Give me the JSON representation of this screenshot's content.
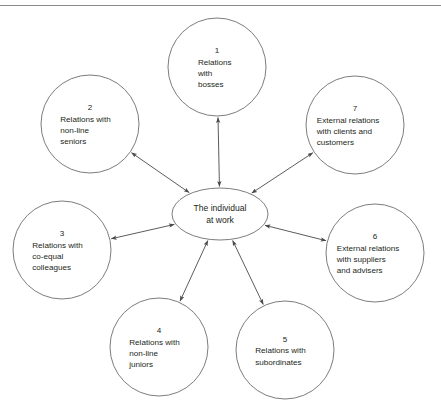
{
  "figure": {
    "type": "hub-and-spoke relationship diagram",
    "center": {
      "label_lines": [
        "The individual",
        "at work"
      ],
      "shape": "ellipse",
      "cx": 220,
      "cy": 214,
      "rx": 48,
      "ry": 26
    },
    "rule_color": "#8a8a8a",
    "node_stroke_color": "#6d6d6d",
    "connector_color": "#4a4a4a",
    "text_color": "#231f20",
    "background_color": "#ffffff",
    "caption_partial": "",
    "nodes": [
      {
        "number": "1",
        "lines": [
          "Relations",
          "with",
          "bosses"
        ],
        "cx": 217,
        "cy": 67,
        "r": 49,
        "arrow": "double"
      },
      {
        "number": "2",
        "lines": [
          "Relations with",
          "non-line",
          "seniors"
        ],
        "cx": 90,
        "cy": 124,
        "r": 49,
        "arrow": "double"
      },
      {
        "number": "3",
        "lines": [
          "Relations with",
          "co-equal",
          "colleagues"
        ],
        "cx": 62,
        "cy": 250,
        "r": 49,
        "arrow": "double"
      },
      {
        "number": "4",
        "lines": [
          "Relations with",
          "non-line",
          "juniors"
        ],
        "cx": 159,
        "cy": 347,
        "r": 49,
        "arrow": "double"
      },
      {
        "number": "5",
        "lines": [
          "Relations with",
          "subordinates"
        ],
        "cx": 285,
        "cy": 350,
        "r": 49,
        "arrow": "double"
      },
      {
        "number": "6",
        "lines": [
          "External relations",
          "with suppliers",
          "and advisers"
        ],
        "cx": 375,
        "cy": 253,
        "r": 49,
        "arrow": "double"
      },
      {
        "number": "7",
        "lines": [
          "External relations",
          "with clients and",
          "customers"
        ],
        "cx": 355,
        "cy": 125,
        "r": 49,
        "arrow": "double"
      }
    ]
  }
}
